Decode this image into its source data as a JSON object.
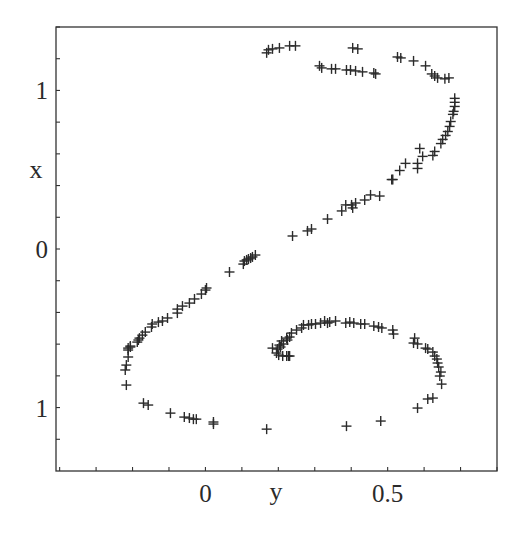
{
  "chart_data": {
    "type": "scatter",
    "title": "",
    "xlabel": "y",
    "ylabel": "x",
    "marker": "cross",
    "marker_color": "#2b2b2b",
    "grid": false,
    "legend": null,
    "xlim": [
      -0.41,
      0.8
    ],
    "ylim": [
      -1.4,
      1.4
    ],
    "x_ticks": [
      {
        "value": 0,
        "label": "0"
      },
      {
        "value": 0.5,
        "label": "0.5"
      }
    ],
    "x_minor_tick_step": 0.1,
    "y_ticks": [
      {
        "value": 1,
        "label": "1"
      },
      {
        "value": 0,
        "label": "0"
      },
      {
        "value": -1,
        "label": "1"
      }
    ],
    "y_minor_tick_step": 0.2,
    "series": [
      {
        "name": "points",
        "points": [
          [
            0.168,
            1.237
          ],
          [
            0.173,
            1.256
          ],
          [
            0.184,
            1.262
          ],
          [
            0.203,
            1.268
          ],
          [
            0.231,
            1.281
          ],
          [
            0.247,
            1.281
          ],
          [
            0.404,
            1.268
          ],
          [
            0.418,
            1.262
          ],
          [
            0.527,
            1.211
          ],
          [
            0.536,
            1.205
          ],
          [
            0.571,
            1.186
          ],
          [
            0.604,
            1.155
          ],
          [
            0.621,
            1.104
          ],
          [
            0.629,
            1.091
          ],
          [
            0.637,
            1.079
          ],
          [
            0.657,
            1.073
          ],
          [
            0.668,
            1.079
          ],
          [
            0.313,
            1.155
          ],
          [
            0.319,
            1.142
          ],
          [
            0.346,
            1.136
          ],
          [
            0.357,
            1.136
          ],
          [
            0.387,
            1.129
          ],
          [
            0.398,
            1.129
          ],
          [
            0.412,
            1.123
          ],
          [
            0.431,
            1.117
          ],
          [
            0.462,
            1.11
          ],
          [
            0.467,
            1.104
          ],
          [
            0.684,
            0.95
          ],
          [
            0.684,
            0.925
          ],
          [
            0.684,
            0.899
          ],
          [
            0.681,
            0.868
          ],
          [
            0.679,
            0.849
          ],
          [
            0.673,
            0.804
          ],
          [
            0.67,
            0.773
          ],
          [
            0.665,
            0.741
          ],
          [
            0.659,
            0.716
          ],
          [
            0.651,
            0.691
          ],
          [
            0.646,
            0.665
          ],
          [
            0.629,
            0.615
          ],
          [
            0.624,
            0.59
          ],
          [
            0.588,
            0.634
          ],
          [
            0.596,
            0.584
          ],
          [
            0.582,
            0.54
          ],
          [
            0.549,
            0.54
          ],
          [
            0.582,
            0.508
          ],
          [
            0.533,
            0.495
          ],
          [
            0.514,
            0.438
          ],
          [
            0.511,
            0.438
          ],
          [
            0.478,
            0.334
          ],
          [
            0.453,
            0.341
          ],
          [
            0.437,
            0.309
          ],
          [
            0.412,
            0.29
          ],
          [
            0.401,
            0.278
          ],
          [
            0.404,
            0.259
          ],
          [
            0.385,
            0.278
          ],
          [
            0.374,
            0.24
          ],
          [
            0.335,
            0.189
          ],
          [
            0.291,
            0.126
          ],
          [
            0.28,
            0.114
          ],
          [
            0.239,
            0.082
          ],
          [
            0.137,
            -0.038
          ],
          [
            0.129,
            -0.05
          ],
          [
            0.124,
            -0.057
          ],
          [
            0.118,
            -0.063
          ],
          [
            0.113,
            -0.069
          ],
          [
            0.107,
            -0.076
          ],
          [
            0.104,
            -0.095
          ],
          [
            0.066,
            -0.145
          ],
          [
            0.003,
            -0.246
          ],
          [
            0.0,
            -0.259
          ],
          [
            -0.011,
            -0.284
          ],
          [
            -0.03,
            -0.315
          ],
          [
            -0.044,
            -0.341
          ],
          [
            -0.063,
            -0.36
          ],
          [
            -0.077,
            -0.379
          ],
          [
            -0.077,
            -0.404
          ],
          [
            -0.104,
            -0.435
          ],
          [
            -0.118,
            -0.454
          ],
          [
            -0.129,
            -0.461
          ],
          [
            -0.146,
            -0.473
          ],
          [
            -0.148,
            -0.492
          ],
          [
            -0.165,
            -0.524
          ],
          [
            -0.173,
            -0.543
          ],
          [
            -0.181,
            -0.562
          ],
          [
            -0.184,
            -0.574
          ],
          [
            -0.187,
            -0.587
          ],
          [
            -0.206,
            -0.612
          ],
          [
            -0.206,
            -0.618
          ],
          [
            -0.212,
            -0.625
          ],
          [
            -0.212,
            -0.637
          ],
          [
            -0.212,
            -0.681
          ],
          [
            -0.217,
            -0.732
          ],
          [
            -0.22,
            -0.763
          ],
          [
            -0.217,
            -0.858
          ],
          [
            -0.17,
            -0.972
          ],
          [
            -0.157,
            -0.984
          ],
          [
            -0.096,
            -1.035
          ],
          [
            -0.058,
            -1.06
          ],
          [
            -0.044,
            -1.066
          ],
          [
            -0.033,
            -1.073
          ],
          [
            -0.025,
            -1.073
          ],
          [
            0.022,
            -1.104
          ],
          [
            0.022,
            -1.091
          ],
          [
            0.168,
            -1.136
          ],
          [
            0.387,
            -1.117
          ],
          [
            0.481,
            -1.085
          ],
          [
            0.582,
            -1.003
          ],
          [
            0.61,
            -0.946
          ],
          [
            0.624,
            -0.94
          ],
          [
            0.648,
            -0.852
          ],
          [
            0.643,
            -0.801
          ],
          [
            0.646,
            -0.776
          ],
          [
            0.64,
            -0.744
          ],
          [
            0.637,
            -0.719
          ],
          [
            0.635,
            -0.694
          ],
          [
            0.629,
            -0.675
          ],
          [
            0.624,
            -0.65
          ],
          [
            0.61,
            -0.631
          ],
          [
            0.604,
            -0.625
          ],
          [
            0.582,
            -0.599
          ],
          [
            0.571,
            -0.593
          ],
          [
            0.574,
            -0.562
          ],
          [
            0.516,
            -0.536
          ],
          [
            0.514,
            -0.511
          ],
          [
            0.484,
            -0.498
          ],
          [
            0.475,
            -0.492
          ],
          [
            0.462,
            -0.486
          ],
          [
            0.437,
            -0.473
          ],
          [
            0.426,
            -0.473
          ],
          [
            0.407,
            -0.467
          ],
          [
            0.396,
            -0.461
          ],
          [
            0.385,
            -0.467
          ],
          [
            0.357,
            -0.454
          ],
          [
            0.341,
            -0.461
          ],
          [
            0.335,
            -0.467
          ],
          [
            0.327,
            -0.454
          ],
          [
            0.316,
            -0.467
          ],
          [
            0.302,
            -0.473
          ],
          [
            0.291,
            -0.473
          ],
          [
            0.283,
            -0.479
          ],
          [
            0.269,
            -0.479
          ],
          [
            0.264,
            -0.498
          ],
          [
            0.25,
            -0.511
          ],
          [
            0.236,
            -0.53
          ],
          [
            0.231,
            -0.555
          ],
          [
            0.225,
            -0.574
          ],
          [
            0.214,
            -0.599
          ],
          [
            0.206,
            -0.618
          ],
          [
            0.184,
            -0.625
          ],
          [
            0.223,
            -0.562
          ],
          [
            0.209,
            -0.58
          ],
          [
            0.203,
            -0.606
          ],
          [
            0.198,
            -0.631
          ],
          [
            0.195,
            -0.656
          ],
          [
            0.201,
            -0.669
          ],
          [
            0.212,
            -0.675
          ],
          [
            0.223,
            -0.675
          ],
          [
            0.228,
            -0.675
          ],
          [
            0.231,
            -0.675
          ]
        ]
      }
    ]
  }
}
